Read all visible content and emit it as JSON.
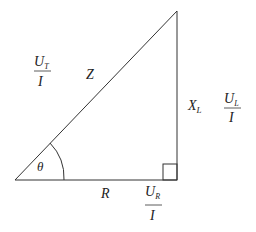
{
  "diagram": {
    "type": "impedance-triangle",
    "vertices": {
      "bottom_left": [
        15,
        180
      ],
      "bottom_right": [
        177,
        180
      ],
      "top_right": [
        177,
        11
      ]
    },
    "line_color": "#333333",
    "labels": {
      "hypotenuse": "Z",
      "vertical_side": "X",
      "vertical_side_sub": "L",
      "horizontal_side": "R",
      "angle": "θ"
    },
    "fractions": {
      "total": {
        "numerator": "U",
        "numerator_sub": "T",
        "denominator": "I"
      },
      "inductive": {
        "numerator": "U",
        "numerator_sub": "L",
        "denominator": "I"
      },
      "resistive": {
        "numerator": "U",
        "numerator_sub": "R",
        "denominator": "I"
      }
    }
  }
}
